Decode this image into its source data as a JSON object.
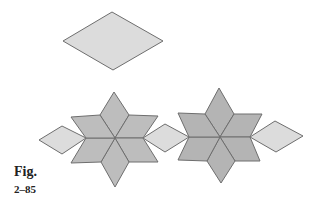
{
  "figure": {
    "label": "Fig.",
    "number": "2–85"
  },
  "colors": {
    "light_fill": "#dcdcdc",
    "dark_fill": "#b4b4b4",
    "stroke": "#6e6e6e"
  },
  "shapes": {
    "single_rhombus": "rhombus",
    "left_star": "six-rhombus star with side rhombus",
    "right_star": "six-rhombus star with side rhombi"
  }
}
